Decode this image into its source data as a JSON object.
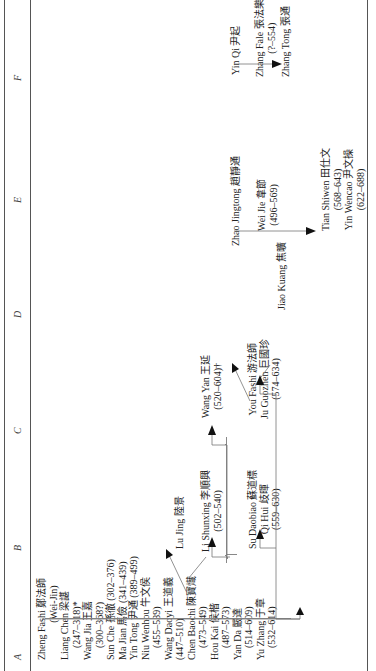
{
  "columns": [
    "A",
    "B",
    "C",
    "D",
    "E",
    "F"
  ],
  "nodes": {
    "zheng_fashi": {
      "name": "Zheng Fashi 鄭法師",
      "note": "(Wei-Jin)"
    },
    "liang_chen": {
      "name": "Liang Chen 梁諶",
      "dates": "(247–318)*"
    },
    "wang_jia": {
      "name": "Wang Jia 王嘉",
      "dates": "(300–368?)"
    },
    "sun_che": {
      "name": "Sun Che 孫徹",
      "dates": "(302–376)"
    },
    "ma_jian": {
      "name": "Ma Jian 馬儉",
      "dates": "(341–439)"
    },
    "yin_tong": {
      "name": "Yin Tong 尹通",
      "dates": "(389–499)"
    },
    "niu_wenhou": {
      "name": "Niu Wenhou 牛文侯",
      "dates": "(455–539)"
    },
    "wang_daoyi": {
      "name": "Wang Daoyi 王道義",
      "dates": "(447–510)"
    },
    "chen_baochi": {
      "name": "Chen Baochi 陳寶熾",
      "dates": "(473–549)"
    },
    "hou_kai": {
      "name": "Hou Kai 侯楷",
      "dates": "(487–573)"
    },
    "yan_da": {
      "name": "Yan Da 嚴達",
      "dates": "(514–609)"
    },
    "yu_zhang": {
      "name": "Yu Zhang 于章",
      "dates": "(532–614)"
    },
    "lu_jing": {
      "name": "Lu Jing 陸景"
    },
    "li_shunxing": {
      "name": "Li Shunxing 李順興",
      "dates": "(502–540)"
    },
    "su_daobiao": {
      "name": "Su Daobiao 蘇道標"
    },
    "qi_hui": {
      "name": "Qi Hui 歧暉",
      "dates": "(559–630)"
    },
    "wang_yan": {
      "name": "Wang Yan 王延",
      "dates": "(520–604)†"
    },
    "you_fashi": {
      "name": "You Fashi 游法師"
    },
    "ju_guozhen": {
      "name": "Ju Guozhen 巨國珍",
      "dates": "(574–634)"
    },
    "jiao_kuang": {
      "name": "Jiao Kuang 焦曠"
    },
    "zhao_jingtong": {
      "name": "Zhao Jingtong 趙靜通"
    },
    "wei_jie": {
      "name": "Wei Jie 韋節",
      "dates": "(496–569)"
    },
    "tian_shiwen": {
      "name": "Tian Shiwen 田仕文",
      "dates": "(568–643)"
    },
    "yin_wencao": {
      "name": "Yin Wencao 尹文操",
      "dates": "(622–688)"
    },
    "yin_qi": {
      "name": "Yin Qi 尹起"
    },
    "zhang_fale": {
      "name": "Zhang Fale 張法樂",
      "dates": "(?–554)"
    },
    "zhang_tong": {
      "name": "Zhang Tong 張通"
    }
  }
}
